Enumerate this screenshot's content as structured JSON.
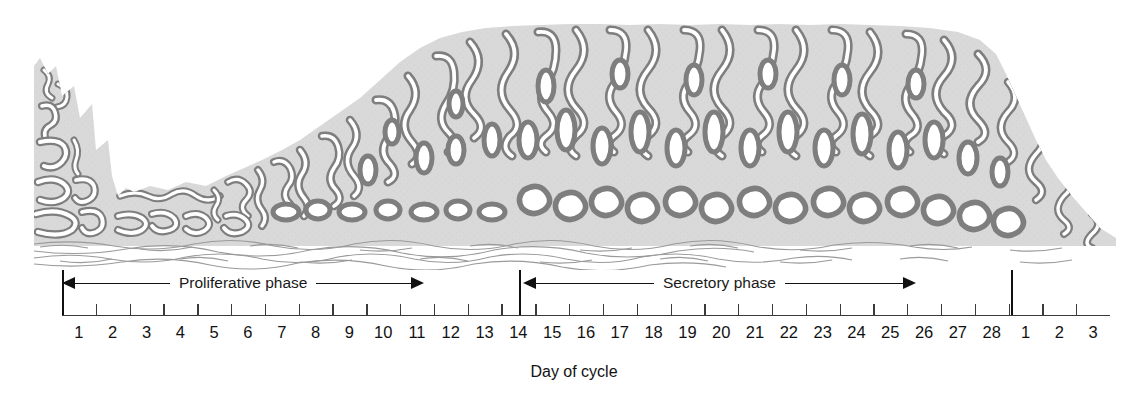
{
  "figure": {
    "axis_caption": "Day of cycle",
    "colors": {
      "gland_wall": "#8a8a8a",
      "gland_wall_outline": "#6f6f6f",
      "stroma": "#d9d9d9",
      "lumen": "#ffffff",
      "myometrium_line": "#9a9a9a",
      "axis": "#3a3a3a",
      "text": "#121212",
      "background": "#ffffff"
    }
  },
  "phases": [
    {
      "id": "proliferative",
      "label": "Proliferative phase",
      "start_day": 1,
      "end_day": 14,
      "arrow_style": "double-headed"
    },
    {
      "id": "secretory",
      "label": "Secretory phase",
      "start_day": 14,
      "end_day": 28,
      "arrow_style": "double-headed"
    }
  ],
  "axis": {
    "caption": "Day of cycle",
    "day_labels": [
      "1",
      "2",
      "3",
      "4",
      "5",
      "6",
      "7",
      "8",
      "9",
      "10",
      "11",
      "12",
      "13",
      "14",
      "15",
      "16",
      "17",
      "18",
      "19",
      "20",
      "21",
      "22",
      "23",
      "24",
      "25",
      "26",
      "27",
      "28",
      "1",
      "2",
      "3"
    ],
    "cycle_restart_after_index": 27,
    "tick_count": 31
  },
  "chart_data": {
    "type": "area",
    "xlabel": "Day of cycle",
    "ylabel": "Endometrial thickness",
    "x": [
      1,
      2,
      3,
      4,
      5,
      6,
      7,
      8,
      9,
      10,
      11,
      12,
      13,
      14,
      15,
      16,
      17,
      18,
      19,
      20,
      21,
      22,
      23,
      24,
      25,
      26,
      27,
      28,
      29,
      30,
      31
    ],
    "thickness_relative": [
      88,
      62,
      18,
      16,
      16,
      20,
      26,
      34,
      46,
      60,
      74,
      86,
      96,
      100,
      100,
      100,
      100,
      100,
      100,
      100,
      100,
      100,
      100,
      100,
      100,
      98,
      96,
      92,
      70,
      46,
      24
    ],
    "gland_morphology": [
      "shedding",
      "shedding",
      "narrow-straight",
      "narrow-straight",
      "narrow-straight",
      "straight-tubular",
      "straight-tubular",
      "straight-tubular",
      "straight-tubular",
      "straight-tubular",
      "straight-tubular",
      "straight-tubular",
      "straight-tubular",
      "straight-tubular",
      "coiled",
      "coiled",
      "coiled",
      "coiled",
      "coiled",
      "coiled",
      "tortuous-sawtooth",
      "tortuous-sawtooth",
      "tortuous-sawtooth",
      "tortuous-sawtooth",
      "tortuous-sawtooth",
      "tortuous-sawtooth",
      "tortuous-sawtooth",
      "tortuous-sawtooth",
      "shedding",
      "shedding",
      "shedding"
    ]
  },
  "layers": [
    {
      "id": "functional-layer",
      "name": "Functional layer (glands and stroma)"
    },
    {
      "id": "basal-layer",
      "name": "Basal layer / myometrium fibers"
    }
  ]
}
